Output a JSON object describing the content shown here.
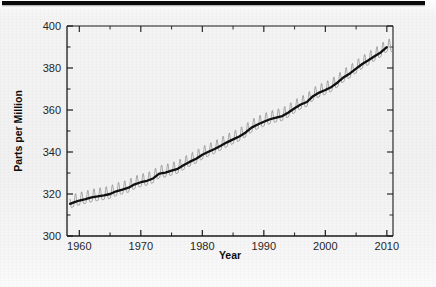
{
  "figure": {
    "background_color": "#f1f1f1",
    "rule_color": "#0b0b0b"
  },
  "axis": {
    "y_title": "Parts per Million",
    "x_title": "Year",
    "y_ticks": [
      "300",
      "320",
      "340",
      "360",
      "380",
      "400"
    ],
    "x_ticks": [
      "1960",
      "1970",
      "1980",
      "1990",
      "2000",
      "2010"
    ]
  },
  "chart_data": {
    "type": "line",
    "title": "",
    "subtitle": "",
    "xlabel": "Year",
    "ylabel": "Parts per Million",
    "xlim": [
      1958,
      2011
    ],
    "ylim": [
      300,
      400
    ],
    "grid": false,
    "legend_position": "none",
    "y_major_tick_step": 20,
    "y_minor_tick_step": 10,
    "x_major_tick_step": 10,
    "x_minor_tick_step": 5,
    "annotations": [],
    "series": [
      {
        "name": "Monthly mean (seasonal cycle)",
        "color": "#8d8d8d",
        "linewidth": 0.8,
        "type": "line",
        "seasonal_amplitude_ppm": 3.0,
        "x": [
          1958.5,
          1959,
          1960,
          1961,
          1962,
          1963,
          1964,
          1965,
          1966,
          1967,
          1968,
          1969,
          1970,
          1971,
          1972,
          1973,
          1974,
          1975,
          1976,
          1977,
          1978,
          1979,
          1980,
          1981,
          1982,
          1983,
          1984,
          1985,
          1986,
          1987,
          1988,
          1989,
          1990,
          1991,
          1992,
          1993,
          1994,
          1995,
          1996,
          1997,
          1998,
          1999,
          2000,
          2001,
          2002,
          2003,
          2004,
          2005,
          2006,
          2007,
          2008,
          2009,
          2010
        ],
        "values": [
          315.3,
          315.9,
          316.9,
          317.6,
          318.4,
          318.9,
          319.4,
          320.0,
          321.3,
          322.1,
          323.0,
          324.6,
          325.6,
          326.3,
          327.4,
          329.7,
          330.2,
          331.1,
          332.0,
          333.8,
          335.4,
          336.8,
          338.7,
          340.1,
          341.4,
          343.0,
          344.6,
          346.0,
          347.4,
          349.2,
          351.6,
          353.1,
          354.4,
          355.6,
          356.4,
          357.1,
          358.8,
          360.8,
          362.6,
          363.8,
          366.6,
          368.3,
          369.5,
          371.0,
          373.1,
          375.6,
          377.4,
          379.7,
          381.9,
          383.7,
          385.6,
          387.4,
          389.9
        ]
      },
      {
        "name": "Smoothed annual trend",
        "color": "#111111",
        "linewidth": 2.4,
        "type": "line",
        "x": [
          1958.5,
          1959,
          1960,
          1961,
          1962,
          1963,
          1964,
          1965,
          1966,
          1967,
          1968,
          1969,
          1970,
          1971,
          1972,
          1973,
          1974,
          1975,
          1976,
          1977,
          1978,
          1979,
          1980,
          1981,
          1982,
          1983,
          1984,
          1985,
          1986,
          1987,
          1988,
          1989,
          1990,
          1991,
          1992,
          1993,
          1994,
          1995,
          1996,
          1997,
          1998,
          1999,
          2000,
          2001,
          2002,
          2003,
          2004,
          2005,
          2006,
          2007,
          2008,
          2009,
          2010
        ],
        "values": [
          315.3,
          315.9,
          316.9,
          317.6,
          318.4,
          318.9,
          319.4,
          320.0,
          321.3,
          322.1,
          323.0,
          324.6,
          325.6,
          326.3,
          327.4,
          329.7,
          330.2,
          331.1,
          332.0,
          333.8,
          335.4,
          336.8,
          338.7,
          340.1,
          341.4,
          343.0,
          344.6,
          346.0,
          347.4,
          349.2,
          351.6,
          353.1,
          354.4,
          355.6,
          356.4,
          357.1,
          358.8,
          360.8,
          362.6,
          363.8,
          366.6,
          368.3,
          369.5,
          371.0,
          373.1,
          375.6,
          377.4,
          379.7,
          381.9,
          383.7,
          385.6,
          387.4,
          389.9
        ]
      }
    ]
  }
}
